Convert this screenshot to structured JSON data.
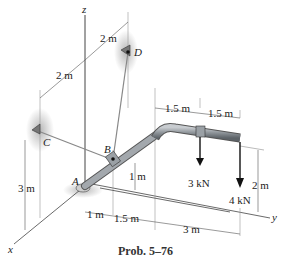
{
  "figure": {
    "caption": "Prob. 5–76",
    "axes": {
      "x": "x",
      "y": "y",
      "z": "z"
    },
    "points": {
      "A": "A",
      "B": "B",
      "C": "C",
      "D": "D"
    },
    "dimensions": {
      "top_cd_upper": "2 m",
      "top_cd_lower": "2 m",
      "height_c": "3 m",
      "b_height": "1 m",
      "base_1": "1 m",
      "base_2": "1.5 m",
      "base_3": "3 m",
      "top_seg_1": "1.5 m",
      "top_seg_2": "1.5 m",
      "end_height": "2 m"
    },
    "loads": {
      "load_1": "3 kN",
      "load_2": "4 kN"
    },
    "colors": {
      "pipe": "#8e9499",
      "cable": "#7a7a7a",
      "line": "#333333",
      "shadow": "#bbbbbb"
    }
  }
}
